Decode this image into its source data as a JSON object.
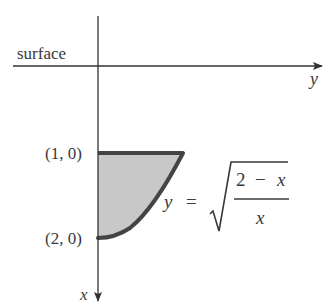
{
  "diagram": {
    "surface_label": "surface",
    "axes": {
      "horizontal_label": "y",
      "vertical_label": "x"
    },
    "points": [
      {
        "label": "(1, 0)"
      },
      {
        "label": "(2, 0)"
      }
    ],
    "equation": {
      "lhs": "y",
      "equals": "=",
      "numerator": "2 − x",
      "numerator_parts": [
        "2",
        "−",
        "x"
      ],
      "denominator": "x",
      "full_text": "y = sqrt((2 − x)/x)"
    },
    "colors": {
      "axis": "#333333",
      "boundary": "#444444",
      "region_fill": "#c8c8c8",
      "text": "#3a3a3a"
    }
  }
}
